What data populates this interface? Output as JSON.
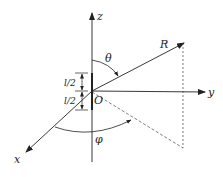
{
  "diagram": {
    "type": "spherical-coordinate-dipole",
    "labels": {
      "z_axis": "z",
      "y_axis": "y",
      "x_axis": "x",
      "origin": "O",
      "radius": "R",
      "theta": "θ",
      "phi": "φ",
      "half_length_top": "l/2",
      "half_length_bottom": "l/2"
    },
    "colors": {
      "stroke": "#222222",
      "background": "#ffffff"
    }
  }
}
